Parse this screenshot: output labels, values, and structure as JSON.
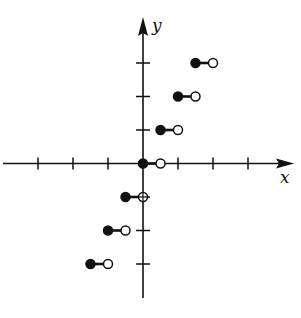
{
  "chart_data": {
    "type": "scatter",
    "title": "",
    "xlabel": "x",
    "ylabel": "y",
    "xlim": [
      -4,
      4.3
    ],
    "ylim": [
      -4,
      4.2
    ],
    "x_ticks": [
      -3,
      -2,
      -1,
      1,
      2,
      3
    ],
    "y_ticks": [
      -3,
      -2,
      -1,
      1,
      2,
      3
    ],
    "tick_labels_shown": false,
    "grid": false,
    "legend": null,
    "segments": [
      {
        "y": -3,
        "x_start": -1.5,
        "x_end": -1.0,
        "start_closed": true,
        "end_closed": false
      },
      {
        "y": -2,
        "x_start": -1.0,
        "x_end": -0.5,
        "start_closed": true,
        "end_closed": false
      },
      {
        "y": -1,
        "x_start": -0.5,
        "x_end": 0.0,
        "start_closed": true,
        "end_closed": false
      },
      {
        "y": 0,
        "x_start": 0.0,
        "x_end": 0.5,
        "start_closed": true,
        "end_closed": false
      },
      {
        "y": 1,
        "x_start": 0.5,
        "x_end": 1.0,
        "start_closed": true,
        "end_closed": false
      },
      {
        "y": 2,
        "x_start": 1.0,
        "x_end": 1.5,
        "start_closed": true,
        "end_closed": false
      },
      {
        "y": 3,
        "x_start": 1.5,
        "x_end": 2.0,
        "start_closed": true,
        "end_closed": false
      }
    ]
  },
  "labels": {
    "x_axis": "x",
    "y_axis": "y"
  },
  "colors": {
    "ink": "#111111",
    "background": "#ffffff"
  }
}
